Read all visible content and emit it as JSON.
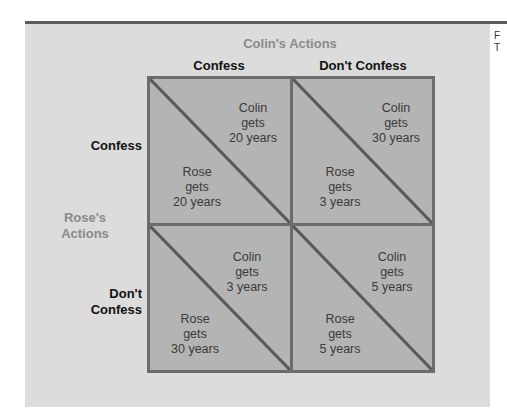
{
  "colin_axis": {
    "title": "Colin's Actions",
    "options": [
      "Confess",
      "Don't Confess"
    ]
  },
  "rose_axis": {
    "title_line1": "Rose's",
    "title_line2": "Actions",
    "options": [
      {
        "line1": "Confess",
        "line2": ""
      },
      {
        "line1": "Don't",
        "line2": "Confess"
      }
    ]
  },
  "cells": [
    {
      "rose_action": "Confess",
      "colin_action": "Confess",
      "colin": [
        "Colin",
        "gets",
        "20 years"
      ],
      "rose": [
        "Rose",
        "gets",
        "20 years"
      ]
    },
    {
      "rose_action": "Confess",
      "colin_action": "Don't Confess",
      "colin": [
        "Colin",
        "gets",
        "30 years"
      ],
      "rose": [
        "Rose",
        "gets",
        "3 years"
      ]
    },
    {
      "rose_action": "Don't Confess",
      "colin_action": "Confess",
      "colin": [
        "Colin",
        "gets",
        "3 years"
      ],
      "rose": [
        "Rose",
        "gets",
        "30 years"
      ]
    },
    {
      "rose_action": "Don't Confess",
      "colin_action": "Don't Confess",
      "colin": [
        "Colin",
        "gets",
        "5 years"
      ],
      "rose": [
        "Rose",
        "gets",
        "5 years"
      ]
    }
  ],
  "side_fragment": [
    "F",
    "T"
  ],
  "colors": {
    "cell_fill": "#b4b4b4",
    "cell_border": "#6c6c6c",
    "panel": "#dcdcdc",
    "axis_title": "#8a8a8a"
  }
}
